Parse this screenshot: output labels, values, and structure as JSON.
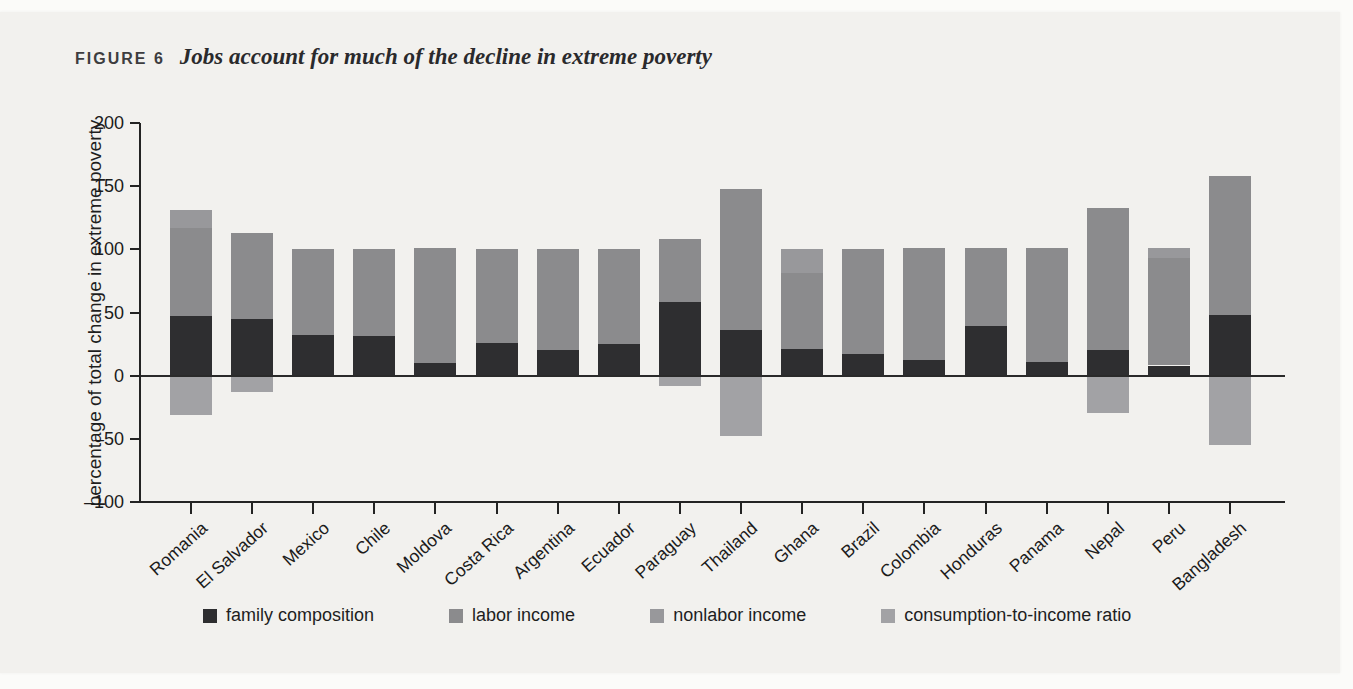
{
  "figure": {
    "label": "FIGURE 6",
    "title": "Jobs account for much of the decline in extreme poverty"
  },
  "colors": {
    "paper": "#f2f1ee",
    "axis": "#232323",
    "family_composition": "#2e2e30",
    "labor_income": "#8b8b8d",
    "nonlabor_income": "#98989b",
    "consumption_to_income_ratio": "#a2a2a5"
  },
  "legend": {
    "items": [
      {
        "label": "family composition",
        "color": "#2e2e30"
      },
      {
        "label": "labor income",
        "color": "#8b8b8d"
      },
      {
        "label": "nonlabor income",
        "color": "#98989b"
      },
      {
        "label": "consumption-to-income ratio",
        "color": "#a2a2a5"
      }
    ]
  },
  "chart_data": {
    "type": "bar",
    "stacked": true,
    "title": "FIGURE 6  Jobs account for much of the decline in extreme poverty",
    "xlabel": "",
    "ylabel": "percentage of total change in extreme poverty",
    "ylim": [
      -100,
      200
    ],
    "yticks": [
      200,
      150,
      100,
      50,
      0,
      -50,
      -100
    ],
    "ytick_labels": [
      "200",
      "150",
      "100",
      "50",
      "0",
      "–50",
      "–100"
    ],
    "grid": false,
    "legend_position": "bottom",
    "categories": [
      "Romania",
      "El Salvador",
      "Mexico",
      "Chile",
      "Moldova",
      "Costa Rica",
      "Argentina",
      "Ecuador",
      "Paraguay",
      "Thailand",
      "Ghana",
      "Brazil",
      "Colombia",
      "Honduras",
      "Panama",
      "Nepal",
      "Peru",
      "Bangladesh"
    ],
    "series": [
      {
        "name": "family composition",
        "color": "#2e2e30",
        "values": [
          47,
          45,
          32,
          31,
          10,
          26,
          20,
          25,
          58,
          36,
          21,
          17,
          12,
          39,
          11,
          20,
          8,
          48
        ]
      },
      {
        "name": "labor income",
        "color": "#8b8b8d",
        "values": [
          70,
          68,
          68,
          69,
          91,
          74,
          80,
          75,
          50,
          112,
          60,
          83,
          89,
          62,
          90,
          113,
          85,
          110
        ]
      },
      {
        "name": "nonlabor income",
        "color": "#98989b",
        "values": [
          14,
          0,
          0,
          0,
          0,
          0,
          0,
          0,
          0,
          0,
          19,
          0,
          0,
          0,
          0,
          0,
          8,
          0
        ]
      },
      {
        "name": "consumption-to-income ratio",
        "color": "#a2a2a5",
        "values": [
          -31,
          -13,
          0,
          0,
          0,
          0,
          0,
          0,
          -8,
          -48,
          0,
          0,
          0,
          0,
          0,
          -30,
          0,
          -55
        ]
      }
    ]
  }
}
